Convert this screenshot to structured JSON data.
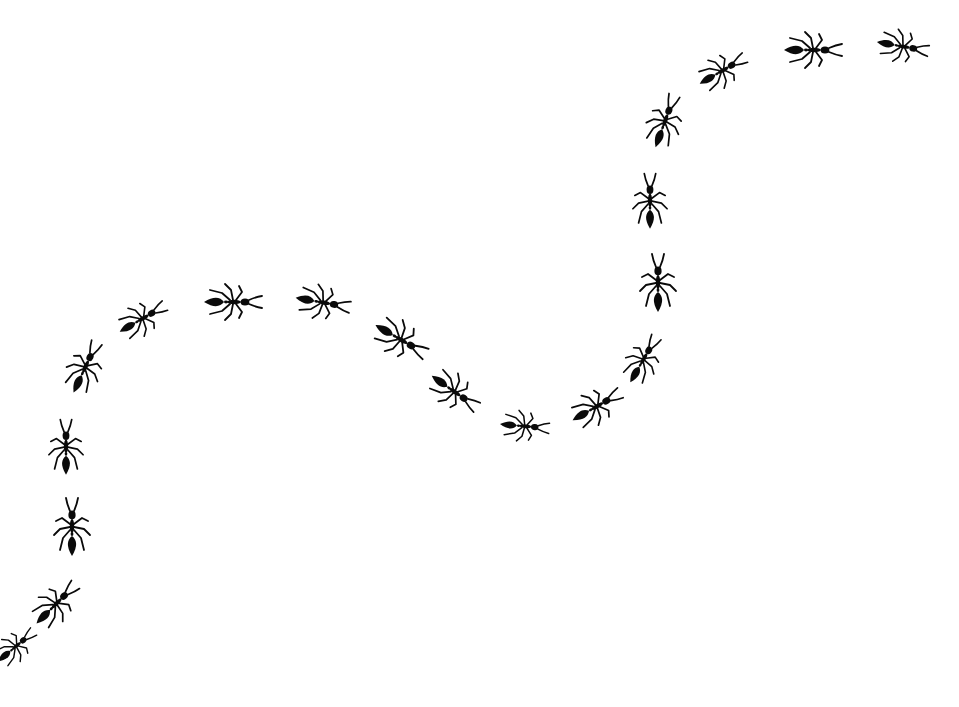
{
  "image": {
    "description": "Black silhouette ants walking in a wavy S-shaped trail on a white background",
    "background_color": "#ffffff",
    "ant_color": "#0a0a0a"
  },
  "ants": [
    {
      "x": 14,
      "y": 648,
      "angle": 50,
      "scale": 0.8
    },
    {
      "x": 54,
      "y": 606,
      "angle": 45,
      "scale": 0.95
    },
    {
      "x": 72,
      "y": 530,
      "angle": 0,
      "scale": 1.0
    },
    {
      "x": 66,
      "y": 450,
      "angle": 0,
      "scale": 0.95
    },
    {
      "x": 84,
      "y": 370,
      "angle": 25,
      "scale": 0.95
    },
    {
      "x": 140,
      "y": 320,
      "angle": 60,
      "scale": 0.9
    },
    {
      "x": 230,
      "y": 302,
      "angle": 90,
      "scale": 1.0
    },
    {
      "x": 320,
      "y": 302,
      "angle": 100,
      "scale": 0.95
    },
    {
      "x": 398,
      "y": 338,
      "angle": 120,
      "scale": 1.0
    },
    {
      "x": 452,
      "y": 390,
      "angle": 125,
      "scale": 0.95
    },
    {
      "x": 522,
      "y": 426,
      "angle": 95,
      "scale": 0.85
    },
    {
      "x": 594,
      "y": 408,
      "angle": 60,
      "scale": 0.95
    },
    {
      "x": 642,
      "y": 362,
      "angle": 30,
      "scale": 0.9
    },
    {
      "x": 658,
      "y": 286,
      "angle": 0,
      "scale": 1.0
    },
    {
      "x": 650,
      "y": 204,
      "angle": 0,
      "scale": 0.95
    },
    {
      "x": 664,
      "y": 124,
      "angle": 20,
      "scale": 0.95
    },
    {
      "x": 720,
      "y": 72,
      "angle": 60,
      "scale": 0.9
    },
    {
      "x": 810,
      "y": 50,
      "angle": 90,
      "scale": 1.0
    },
    {
      "x": 900,
      "y": 46,
      "angle": 100,
      "scale": 0.9
    }
  ]
}
